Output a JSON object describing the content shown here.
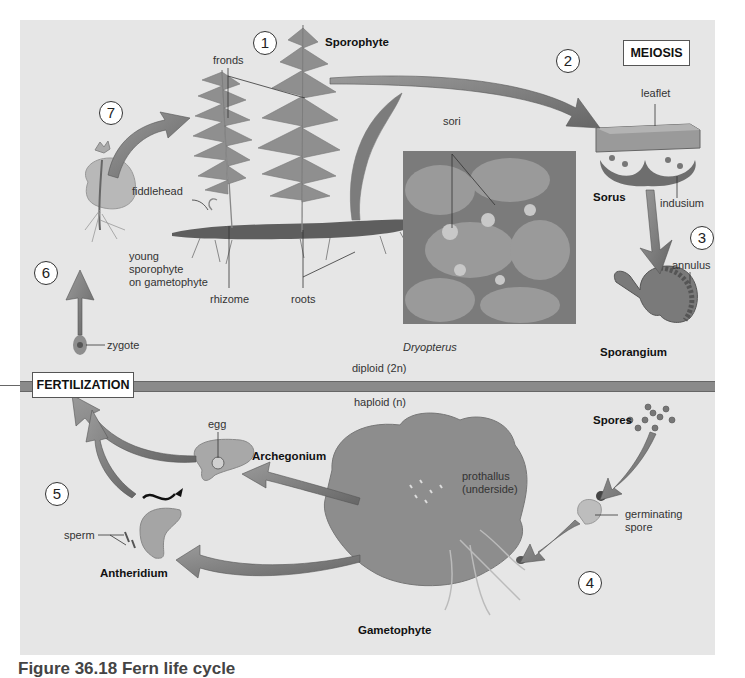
{
  "figure": {
    "title": "Fern life cycle",
    "caption_partial": "Figure 36.18 Fern life cycle"
  },
  "steps": [
    "1",
    "2",
    "3",
    "4",
    "5",
    "6",
    "7"
  ],
  "boxes": {
    "meiosis": "MEIOSIS",
    "fertilization": "FERTILIZATION"
  },
  "ploidy": {
    "diploid": "diploid (2n)",
    "haploid": "haploid (n)"
  },
  "sporophyte": {
    "title": "Sporophyte",
    "fronds": "fronds",
    "fiddlehead": "fiddlehead",
    "rhizome": "rhizome",
    "roots": "roots",
    "young": [
      "young",
      "sporophyte",
      "on gametophyte"
    ],
    "zygote": "zygote"
  },
  "sorus": {
    "leaflet": "leaflet",
    "title": "Sorus",
    "indusium": "indusium"
  },
  "photo": {
    "sori": "sori",
    "species": "Dryopterus"
  },
  "sporangium": {
    "annulus": "annulus",
    "title": "Sporangium"
  },
  "gametophyte": {
    "spores": "Spores",
    "germinating": [
      "germinating",
      "spore"
    ],
    "prothallus": [
      "prothallus",
      "(underside)"
    ],
    "title": "Gametophyte",
    "archegonium": "Archegonium",
    "egg": "egg",
    "antheridium": "Antheridium",
    "sperm": "sperm"
  },
  "colors": {
    "background": "#e6e6e6",
    "arrow": "#7d7d7d",
    "divider": "#8a8a8a",
    "text": "#222222"
  }
}
